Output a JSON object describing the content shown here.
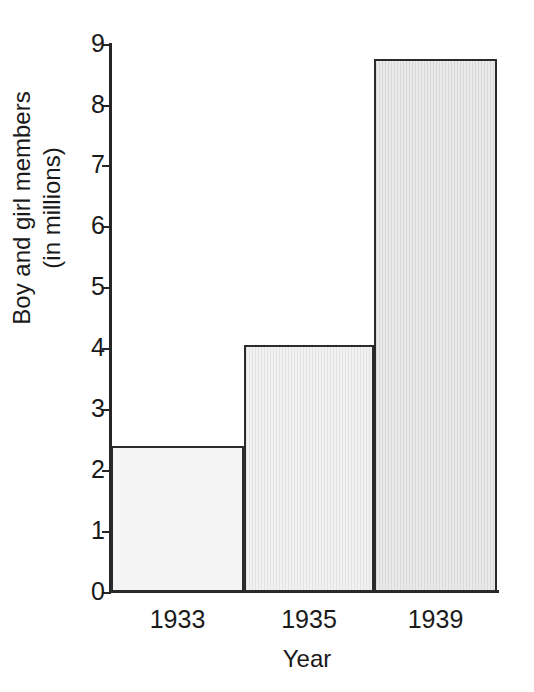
{
  "chart_data": {
    "type": "bar",
    "title": "",
    "subtitle": "",
    "categories": [
      "1933",
      "1935",
      "1939"
    ],
    "values": [
      2.4,
      4.05,
      8.75
    ],
    "series": [
      {
        "name": "Boy and girl members (in millions)",
        "values": [
          2.4,
          4.05,
          8.75
        ]
      }
    ],
    "xlabel": "Year",
    "ylabel": "Boy and girl members",
    "ylabel_line1": "Boy and girl members",
    "ylabel_line2": "(in millions)",
    "ylim": [
      0,
      9
    ],
    "xlim": [
      0,
      3
    ],
    "yticks": [
      0,
      1,
      2,
      3,
      4,
      5,
      6,
      7,
      8,
      9
    ],
    "ytick_labels": [
      "0",
      "1",
      "2",
      "3",
      "4",
      "5",
      "6",
      "7",
      "8",
      "9"
    ],
    "grid": false,
    "legend": false,
    "legend_position": "none",
    "annotations": [],
    "bar_colors": [
      "#f4f4f4",
      "#f2f2f2",
      "#eaeaea"
    ],
    "bar_edge_color": "#2b2b2b",
    "axis_color": "#262626",
    "background_color": "#ffffff",
    "bars_contiguous": true
  },
  "axes": {
    "y_ticks": [
      {
        "label": "9",
        "value": 9
      },
      {
        "label": "8",
        "value": 8
      },
      {
        "label": "7",
        "value": 7
      },
      {
        "label": "6",
        "value": 6
      },
      {
        "label": "5",
        "value": 5
      },
      {
        "label": "4",
        "value": 4
      },
      {
        "label": "3",
        "value": 3
      },
      {
        "label": "2",
        "value": 2
      },
      {
        "label": "1",
        "value": 1
      },
      {
        "label": "0",
        "value": 0
      }
    ],
    "x_categories": [
      {
        "label": "1933"
      },
      {
        "label": "1935"
      },
      {
        "label": "1939"
      }
    ],
    "x_axis_title": "Year",
    "y_axis_title_line1": "Boy and girl members",
    "y_axis_title_line2": "(in millions)"
  }
}
